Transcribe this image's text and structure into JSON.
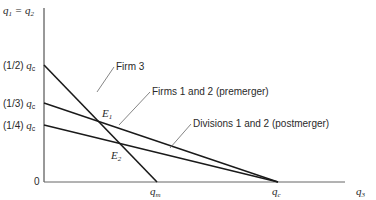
{
  "diagram": {
    "y_axis_label": {
      "base": "q",
      "sub1": "1",
      "eq": " = ",
      "sub2": "2"
    },
    "x_axis_label": {
      "base": "q",
      "sub": "3"
    },
    "origin_label": "0",
    "y_ticks": [
      {
        "prefix": "(1/2) ",
        "base": "q",
        "sub": "c"
      },
      {
        "prefix": "(1/3) ",
        "base": "q",
        "sub": "c"
      },
      {
        "prefix": "(1/4) ",
        "base": "q",
        "sub": "c"
      }
    ],
    "x_ticks": [
      {
        "base": "q",
        "sub": "m"
      },
      {
        "base": "q",
        "sub": "c"
      }
    ],
    "curve_labels": {
      "firm3": "Firm 3",
      "premerger": "Firms 1 and 2 (premerger)",
      "postmerger": "Divisions 1 and 2 (postmerger)"
    },
    "points": [
      {
        "base": "E",
        "sub": "1"
      },
      {
        "base": "E",
        "sub": "2"
      }
    ],
    "colors": {
      "line": "#1a1a1a",
      "leader": "#555555",
      "axis": "#333333"
    }
  }
}
